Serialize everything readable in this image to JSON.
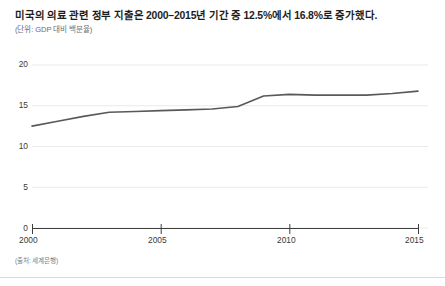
{
  "header": {
    "title": "미국의 의료 관련 정부 지출은 2000–2015년 기간 중 12.5%에서 16.8%로 증가했다.",
    "subtitle": "(단위: GDP 대비 백분율)"
  },
  "footer": {
    "source": "(출처: 세계은행)"
  },
  "colors": {
    "line": "#58595b",
    "grid": "#e8e9ea",
    "axis": "#3f3f3e",
    "title": "#1d1d1b",
    "subtitle": "#6d6e71",
    "source": "#7b7c7e",
    "rule": "#d9dadb",
    "background": "#ffffff"
  },
  "axis": {
    "y_ticks": [
      "0",
      "5",
      "10",
      "15",
      "20"
    ],
    "x_ticks": [
      "2000",
      "2005",
      "2010",
      "2015"
    ]
  },
  "chart_data": {
    "type": "line",
    "title": "미국의 의료 관련 정부 지출은 2000–2015년 기간 중 12.5%에서 16.8%로 증가했다.",
    "subtitle": "(단위: GDP 대비 백분율)",
    "xlabel": "",
    "ylabel": "",
    "units": "GDP 대비 백분율",
    "source": "세계은행",
    "grid": true,
    "legend": false,
    "xlim": [
      2000,
      2015
    ],
    "ylim": [
      0,
      20
    ],
    "ytick_values": [
      0,
      5,
      10,
      15,
      20
    ],
    "xtick_values": [
      2000,
      2005,
      2010,
      2015
    ],
    "x": [
      2000,
      2001,
      2002,
      2003,
      2004,
      2005,
      2006,
      2007,
      2008,
      2009,
      2010,
      2011,
      2012,
      2013,
      2014,
      2015
    ],
    "series": [
      {
        "name": "미국 의료 관련 정부 지출",
        "values": [
          12.5,
          13.1,
          13.7,
          14.2,
          14.3,
          14.4,
          14.5,
          14.6,
          14.9,
          16.2,
          16.4,
          16.3,
          16.3,
          16.3,
          16.5,
          16.8
        ]
      }
    ],
    "annotations": [
      {
        "label": "시작값",
        "x": 2000,
        "y": 12.5
      },
      {
        "label": "종료값",
        "x": 2015,
        "y": 16.8
      }
    ]
  }
}
